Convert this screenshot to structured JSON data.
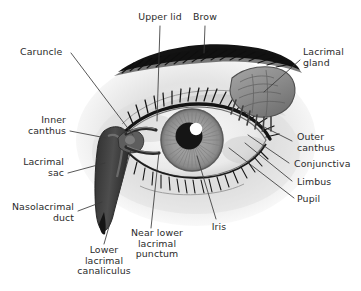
{
  "figure": {
    "kind": "anatomical-diagram",
    "background_color": "#ffffff",
    "text_color": "#2b2b2b",
    "leader_line_color": "#3a3a3a"
  },
  "labels": [
    {
      "id": "upper-lid",
      "text": "Upper lid",
      "align": "center"
    },
    {
      "id": "brow",
      "text": "Brow",
      "align": "center"
    },
    {
      "id": "lacrimal-gland",
      "text": "Lacrimal\ngland",
      "align": "left"
    },
    {
      "id": "caruncle",
      "text": "Caruncle",
      "align": "left"
    },
    {
      "id": "inner-canthus",
      "text": "Inner\ncanthus",
      "align": "right"
    },
    {
      "id": "lacrimal-sac",
      "text": "Lacrimal\nsac",
      "align": "right"
    },
    {
      "id": "nasolacrimal-duct",
      "text": "Nasolacrimal\nduct",
      "align": "right"
    },
    {
      "id": "lower-lacrimal-canaliculus",
      "text": "Lower\nlacrimal\ncanaliculus",
      "align": "center"
    },
    {
      "id": "near-lower-lacrimal-punctum",
      "text": "Near lower\nlacrimal\npunctum",
      "align": "center"
    },
    {
      "id": "iris",
      "text": "Iris",
      "align": "center"
    },
    {
      "id": "pupil",
      "text": "Pupil",
      "align": "left"
    },
    {
      "id": "limbus",
      "text": "Limbus",
      "align": "left"
    },
    {
      "id": "conjunctiva",
      "text": "Conjunctiva",
      "align": "left"
    },
    {
      "id": "outer-canthus",
      "text": "Outer\ncanthus",
      "align": "left"
    }
  ],
  "structures": {
    "eyeball_sclera": "#f2f2f2",
    "iris_color": "#9a9a9a",
    "pupil_color": "#1a1a1a",
    "highlight_color": "#ffffff",
    "brow_color": "#111111",
    "lash_color": "#141414",
    "lacrimal_gland_color": "#8c8c8c",
    "lacrimal_sac_color": "#4a4a4a",
    "skin_shadow": "#cfcfcf"
  }
}
